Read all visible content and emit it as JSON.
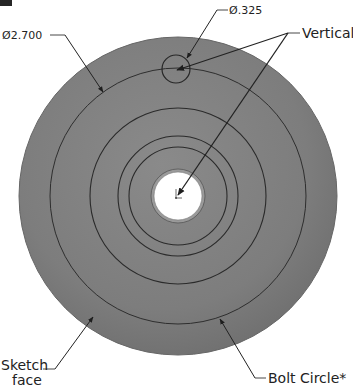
{
  "figure": {
    "type": "CAD sketch annotation",
    "disc_color": "#7e7e7e",
    "disc_edge_color": "#6a6a6a",
    "line_color": "#2a2a2a",
    "hole_color": "#ffffff"
  },
  "callouts": {
    "outer_diameter": {
      "symbol": "Ø",
      "value": "2.700",
      "text": "Ø2.700"
    },
    "hole_diameter": {
      "symbol": "Ø",
      "value": ".325",
      "text": "Ø.325"
    },
    "vertical": {
      "text": "Vertical"
    },
    "sketch_face": {
      "line1": "Sketch",
      "line2": "face"
    },
    "bolt_circle": {
      "text": "Bolt Circle*"
    }
  },
  "geometry": {
    "center": [
      178,
      196
    ],
    "outer_radius": 159,
    "bolt_circle_radius": 128,
    "concentric_radii": [
      88,
      60,
      49
    ],
    "center_hole_radius": 25,
    "center_hole_ring_radius": 27,
    "bolt_hole": {
      "center": [
        176,
        69
      ],
      "radius": 14
    }
  }
}
